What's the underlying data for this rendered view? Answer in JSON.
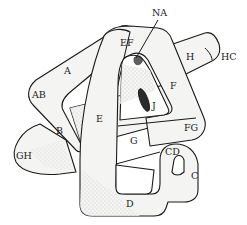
{
  "diagram": {
    "type": "linked-loop knot illustration",
    "style": "hand-drawn stippled line art",
    "colors": {
      "ink": "#1a1a1a",
      "paper": "#ffffff",
      "fill": "#f4f4f2",
      "stipple": "#8a8a8a"
    },
    "labels": {
      "NA": "NA",
      "EF": "EF",
      "H": "H",
      "HC": "HC",
      "A": "A",
      "AB": "AB",
      "F": "F",
      "J": "J",
      "E": "E",
      "B": "B",
      "FG": "FG",
      "G": "G",
      "CD": "CD",
      "GH": "GH",
      "C": "C",
      "D": "D"
    }
  }
}
